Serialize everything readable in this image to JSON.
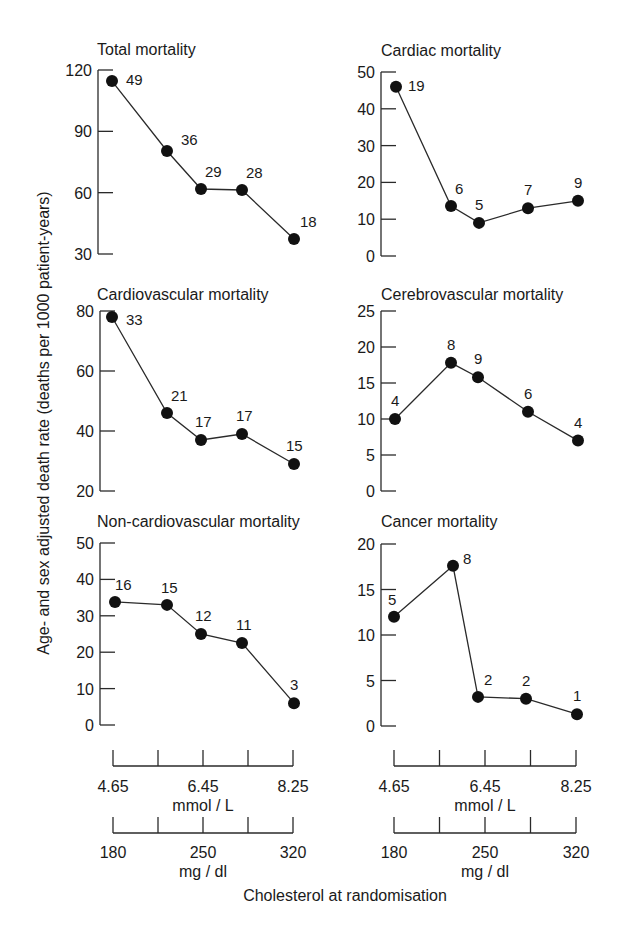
{
  "figure": {
    "ylabel": "Age- and sex adjusted death rate (deaths per 1000 patient-years)",
    "xlabel": "Cholesterol at randomisation",
    "x_axis_mmol": {
      "ticks": [
        "4.65",
        "",
        "6.45",
        "",
        "8.25"
      ],
      "unit": "mmol / L"
    },
    "x_axis_mgdl": {
      "ticks": [
        "180",
        "",
        "250",
        "",
        "320"
      ],
      "unit": "mg / dl"
    }
  },
  "chart_data": [
    {
      "type": "line",
      "title": "Total mortality",
      "x": [
        1,
        2,
        3,
        4,
        5
      ],
      "values": [
        114.6,
        80.4,
        61.8,
        61.3,
        37.3
      ],
      "labels": [
        "49",
        "36",
        "29",
        "28",
        "18"
      ],
      "yticks": [
        "30",
        "60",
        "90",
        "120"
      ],
      "ylim": [
        30,
        120
      ],
      "grid": false
    },
    {
      "type": "line",
      "title": "Cardiac mortality",
      "x": [
        1,
        2,
        3,
        4,
        5
      ],
      "values": [
        46,
        13.6,
        9,
        13,
        15
      ],
      "labels": [
        "19",
        "6",
        "5",
        "7",
        "9"
      ],
      "yticks": [
        "0",
        "10",
        "20",
        "30",
        "40",
        "50"
      ],
      "ylim": [
        0,
        50
      ],
      "grid": false
    },
    {
      "type": "line",
      "title": "Cardiovascular mortality",
      "x": [
        1,
        2,
        3,
        4,
        5
      ],
      "values": [
        78,
        46,
        37,
        39,
        29
      ],
      "labels": [
        "33",
        "21",
        "17",
        "17",
        "15"
      ],
      "yticks": [
        "20",
        "40",
        "60",
        "80"
      ],
      "ylim": [
        20,
        80
      ],
      "grid": false
    },
    {
      "type": "line",
      "title": "Cerebrovascular mortality",
      "x": [
        1,
        2,
        3,
        4,
        5
      ],
      "values": [
        10,
        17.8,
        15.8,
        11,
        7
      ],
      "labels": [
        "4",
        "8",
        "9",
        "6",
        "4"
      ],
      "yticks": [
        "0",
        "5",
        "10",
        "15",
        "20",
        "25"
      ],
      "ylim": [
        0,
        25
      ],
      "grid": false
    },
    {
      "type": "line",
      "title": "Non-cardiovascular mortality",
      "x": [
        1,
        2,
        3,
        4,
        5
      ],
      "values": [
        33.8,
        33,
        25,
        22.5,
        6
      ],
      "labels": [
        "16",
        "15",
        "12",
        "11",
        "3"
      ],
      "yticks": [
        "0",
        "10",
        "20",
        "30",
        "40",
        "50"
      ],
      "ylim": [
        0,
        50
      ],
      "grid": false
    },
    {
      "type": "line",
      "title": "Cancer mortality",
      "x": [
        1,
        2,
        3,
        4,
        5
      ],
      "values": [
        12,
        17.6,
        3.2,
        3,
        1.3
      ],
      "labels": [
        "5",
        "8",
        "2",
        "2",
        "1"
      ],
      "yticks": [
        "0",
        "5",
        "10",
        "15",
        "20"
      ],
      "ylim": [
        0,
        20
      ],
      "grid": false
    }
  ]
}
